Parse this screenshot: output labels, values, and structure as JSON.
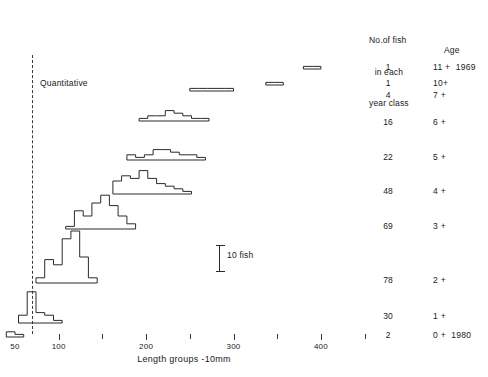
{
  "header": {
    "count_heading_line1": "No.of fish",
    "count_heading_line2": "in each",
    "count_heading_line3": "year class",
    "age_heading": "Age"
  },
  "annotations": {
    "quantitative": "Quantitative",
    "scale_bar_label": "10 fish",
    "scale_bar_value": 10
  },
  "axis": {
    "title": "Length groups -10mm",
    "tick_labels": [
      "50",
      "100",
      "200",
      "300",
      "400"
    ],
    "minor_ticks": true
  },
  "chart_data": {
    "type": "bar",
    "xlabel": "Length groups -10mm",
    "ylabel": "No.of fish in each year class",
    "xlim": [
      50,
      450
    ],
    "x_tick_values": [
      50,
      100,
      200,
      300,
      400
    ],
    "x_minor_tick_values": [
      150,
      250,
      350,
      450
    ],
    "grid": false,
    "legend": "none",
    "scale_reference": {
      "label": "10 fish",
      "count": 10
    },
    "column_headers": [
      "Length groups -10mm",
      "No.of fish in each year class",
      "Age"
    ],
    "rows": [
      {
        "age": "11 +",
        "year": "1969",
        "count": "1",
        "count_value": 1,
        "bins": [
          {
            "x": 380,
            "n": 1
          },
          {
            "x": 390,
            "n": 1
          }
        ]
      },
      {
        "age": "10+",
        "year": "",
        "count": "1",
        "count_value": 1,
        "bins": [
          {
            "x": 337,
            "n": 1
          },
          {
            "x": 347,
            "n": 1
          }
        ]
      },
      {
        "age": "7 +",
        "year": "",
        "count": "4",
        "count_value": 4,
        "bins": [
          {
            "x": 250,
            "n": 1
          },
          {
            "x": 260,
            "n": 1
          },
          {
            "x": 270,
            "n": 1
          },
          {
            "x": 280,
            "n": 1
          },
          {
            "x": 290,
            "n": 1
          }
        ]
      },
      {
        "age": "6 +",
        "year": "",
        "count": "16",
        "count_value": 16,
        "bins": [
          {
            "x": 192,
            "n": 1
          },
          {
            "x": 202,
            "n": 2
          },
          {
            "x": 212,
            "n": 2
          },
          {
            "x": 222,
            "n": 4
          },
          {
            "x": 232,
            "n": 3
          },
          {
            "x": 242,
            "n": 2
          },
          {
            "x": 252,
            "n": 1
          },
          {
            "x": 262,
            "n": 1
          }
        ]
      },
      {
        "age": "5 +",
        "year": "",
        "count": "22",
        "count_value": 22,
        "bins": [
          {
            "x": 178,
            "n": 2
          },
          {
            "x": 188,
            "n": 1
          },
          {
            "x": 198,
            "n": 2
          },
          {
            "x": 208,
            "n": 4
          },
          {
            "x": 218,
            "n": 4
          },
          {
            "x": 228,
            "n": 3
          },
          {
            "x": 238,
            "n": 2
          },
          {
            "x": 248,
            "n": 2
          },
          {
            "x": 258,
            "n": 1
          }
        ]
      },
      {
        "age": "4 +",
        "year": "",
        "count": "48",
        "count_value": 48,
        "bins": [
          {
            "x": 162,
            "n": 5
          },
          {
            "x": 172,
            "n": 7
          },
          {
            "x": 182,
            "n": 6
          },
          {
            "x": 192,
            "n": 9
          },
          {
            "x": 202,
            "n": 6
          },
          {
            "x": 212,
            "n": 4
          },
          {
            "x": 222,
            "n": 3
          },
          {
            "x": 232,
            "n": 2
          },
          {
            "x": 242,
            "n": 1
          }
        ]
      },
      {
        "age": "3 +",
        "year": "",
        "count": "69",
        "count_value": 69,
        "bins": [
          {
            "x": 108,
            "n": 1
          },
          {
            "x": 118,
            "n": 7
          },
          {
            "x": 128,
            "n": 5
          },
          {
            "x": 138,
            "n": 10
          },
          {
            "x": 148,
            "n": 13
          },
          {
            "x": 158,
            "n": 9
          },
          {
            "x": 168,
            "n": 5
          },
          {
            "x": 178,
            "n": 2
          }
        ]
      },
      {
        "age": "2 +",
        "year": "",
        "count": "78",
        "count_value": 78,
        "bins": [
          {
            "x": 74,
            "n": 2
          },
          {
            "x": 84,
            "n": 9
          },
          {
            "x": 94,
            "n": 7
          },
          {
            "x": 104,
            "n": 17
          },
          {
            "x": 114,
            "n": 20
          },
          {
            "x": 124,
            "n": 10
          },
          {
            "x": 134,
            "n": 2
          }
        ]
      },
      {
        "age": "1 +",
        "year": "",
        "count": "30",
        "count_value": 30,
        "bins": [
          {
            "x": 54,
            "n": 3
          },
          {
            "x": 64,
            "n": 12
          },
          {
            "x": 74,
            "n": 4
          },
          {
            "x": 84,
            "n": 3
          },
          {
            "x": 94,
            "n": 1
          }
        ]
      },
      {
        "age": "0 +",
        "year": "1980",
        "count": "2",
        "count_value": 2,
        "bins": [
          {
            "x": 40,
            "n": 2
          },
          {
            "x": 50,
            "n": 1
          }
        ]
      }
    ]
  }
}
